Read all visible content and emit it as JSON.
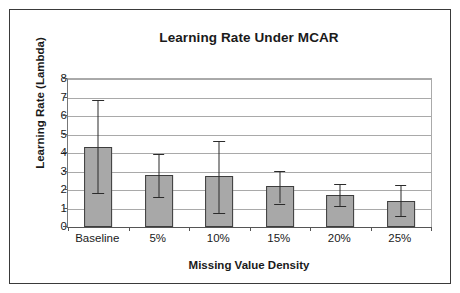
{
  "chart_data": {
    "type": "bar",
    "title": "Learning Rate Under MCAR",
    "xlabel": "Missing Value Density",
    "ylabel": "Learning Rate (Lambda)",
    "categories": [
      "Baseline",
      "5%",
      "10%",
      "15%",
      "20%",
      "25%"
    ],
    "values": [
      4.35,
      2.8,
      2.75,
      2.2,
      1.73,
      1.4
    ],
    "error_upper": [
      6.85,
      3.95,
      4.65,
      3.05,
      2.35,
      2.25
    ],
    "error_lower": [
      1.85,
      1.6,
      0.78,
      1.27,
      1.12,
      0.58
    ],
    "yticks": [
      0,
      1,
      2,
      3,
      4,
      5,
      6,
      7,
      8
    ],
    "ytick_labels": [
      "0",
      "1",
      "2",
      "3",
      "4",
      "5",
      "6",
      "7",
      "8"
    ],
    "ylim": [
      0,
      8
    ],
    "grid": true,
    "legend": false,
    "bar_color": "#a8a8a8",
    "bar_edge_color": "#3d3d3d",
    "error_bar_color": "#2b2b2b",
    "grid_color": "#a9a9a9",
    "text_color": "#1a1a1a",
    "frame_color": "#3a3a3a",
    "background_color": "#ffffff"
  }
}
